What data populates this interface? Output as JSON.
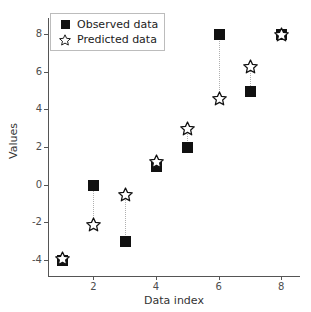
{
  "chart_data": {
    "type": "scatter",
    "title": "",
    "xlabel": "Data index",
    "ylabel": "Values",
    "xlim": [
      0.55,
      8.6
    ],
    "ylim": [
      -4.85,
      8.85
    ],
    "xticks": [
      2,
      4,
      6,
      8
    ],
    "yticks": [
      8,
      6,
      4,
      2,
      0,
      -2,
      -4
    ],
    "xtick_labels": [
      "2",
      "4",
      "6",
      "8"
    ],
    "ytick_labels": [
      "8",
      "6",
      "4",
      "2",
      "0",
      "-2",
      "-4"
    ],
    "grid": false,
    "legend_position": "upper left",
    "x": [
      1,
      2,
      3,
      4,
      5,
      6,
      7,
      8
    ],
    "series": [
      {
        "name": "Observed data",
        "marker": "filled-square",
        "color": "#111111",
        "values": [
          -4,
          0,
          -3,
          1,
          2,
          8,
          5,
          8
        ]
      },
      {
        "name": "Predicted data",
        "marker": "open-star",
        "color": "#111111",
        "values": [
          -3.9,
          -2.1,
          -0.5,
          1.25,
          3.0,
          4.6,
          6.3,
          8.0
        ]
      }
    ],
    "connectors": {
      "style": "dotted",
      "color": "#b0b0b0",
      "description": "vertical dotted line joining observed and predicted at each index"
    }
  },
  "legend": {
    "items": [
      {
        "label": "Observed data",
        "marker": "filled-square"
      },
      {
        "label": "Predicted data",
        "marker": "open-star"
      }
    ]
  }
}
